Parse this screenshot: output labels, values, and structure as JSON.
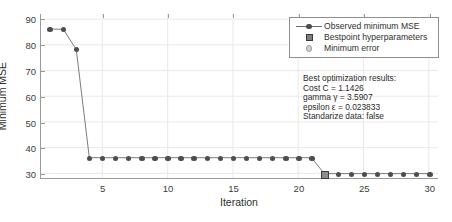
{
  "chart_data": {
    "type": "line",
    "title": "",
    "xlabel": "Iteration",
    "ylabel": "Minimum MSE",
    "xlim": [
      0.3,
      30.7
    ],
    "ylim": [
      28.2,
      92.0
    ],
    "xticks": [
      5,
      10,
      15,
      20,
      25,
      30
    ],
    "yticks": [
      30,
      40,
      50,
      60,
      70,
      80,
      90
    ],
    "grid": true,
    "legend_position": "upper right",
    "x": [
      1,
      2,
      3,
      4,
      5,
      6,
      7,
      8,
      9,
      10,
      11,
      12,
      13,
      14,
      15,
      16,
      17,
      18,
      19,
      20,
      21,
      22,
      23,
      24,
      25,
      26,
      27,
      28,
      29,
      30
    ],
    "series": [
      {
        "name": "Observed minimum MSE",
        "marker": "filled-circle",
        "values": [
          86.1,
          86.1,
          78.2,
          36.1,
          36.1,
          36.1,
          36.1,
          36.1,
          36.1,
          36.1,
          36.1,
          36.1,
          36.1,
          36.1,
          36.1,
          36.1,
          36.1,
          36.1,
          36.1,
          36.1,
          36.1,
          29.9,
          29.9,
          29.9,
          29.9,
          29.9,
          29.9,
          29.9,
          29.9,
          29.9
        ]
      }
    ],
    "bestpoint": {
      "name": "Bestpoint hyperparameters",
      "x": 22,
      "y": 29.9,
      "marker": "filled-square"
    },
    "minimum_error": {
      "name": "Minimum error",
      "marker": "light-circle"
    }
  },
  "legend": {
    "items": [
      {
        "label": "Observed minimum MSE",
        "key": "line-dot"
      },
      {
        "label": "Bestpoint hyperparameters",
        "key": "square"
      },
      {
        "label": "Minimum error",
        "key": "circle"
      }
    ]
  },
  "annotation": {
    "lines": [
      "Best optimization results:",
      "Cost C = 1.1426",
      "gamma γ = 3.5907",
      "epsilon ε = 0.023833",
      "Standarize data: false"
    ]
  },
  "caption": {
    "text": ""
  }
}
